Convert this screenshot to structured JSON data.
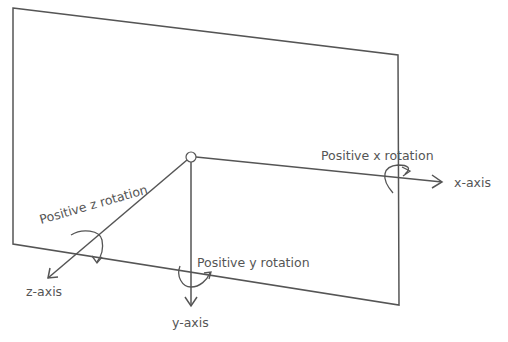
{
  "diagram": {
    "type": "3d-rotation-axes",
    "colors": {
      "line": "#555555",
      "text": "#555555",
      "background": "#ffffff"
    },
    "plane": {
      "corners": [
        [
          13,
          8
        ],
        [
          398,
          55
        ],
        [
          399,
          305
        ],
        [
          13,
          244
        ]
      ]
    },
    "origin": {
      "x": 191,
      "y": 157,
      "r": 5
    },
    "axes": {
      "x": {
        "label": "x-axis",
        "rotation_label": "Positive x rotation"
      },
      "y": {
        "label": "y-axis",
        "rotation_label": "Positive y rotation"
      },
      "z": {
        "label": "z-axis",
        "rotation_label": "Positive z rotation"
      }
    }
  }
}
